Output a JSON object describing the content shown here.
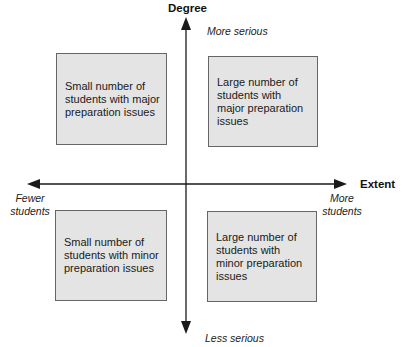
{
  "axes": {
    "vertical": {
      "title": "Degree",
      "top_label": "More serious",
      "bottom_label": "Less serious"
    },
    "horizontal": {
      "title": "Extent",
      "left_label": "Fewer students",
      "right_label": "More students"
    }
  },
  "quadrants": {
    "top_left": "Small number of students with major preparation issues",
    "top_right": "Large number of students with major preparation issues",
    "bottom_left": "Small number of students with minor preparation issues",
    "bottom_right": "Large number of students with minor preparation issues"
  },
  "colors": {
    "box_fill": "#e4e4e4",
    "box_border": "#666666",
    "axis": "#1a1a1a"
  }
}
